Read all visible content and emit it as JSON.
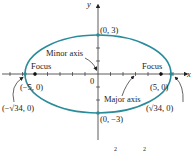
{
  "diagram": {
    "type": "ellipse",
    "axes": {
      "x_label": "x",
      "y_label": "y",
      "origin_label": "0"
    },
    "ellipse_color": "#2a8c9a",
    "points": {
      "top_vertex": "(0, 3)",
      "bottom_vertex": "(0, −3)",
      "left_focus": "(−5, 0)",
      "right_focus": "(5, 0)",
      "left_vertex": "(−√34, 0)",
      "right_vertex": "(√34, 0)"
    },
    "annotations": {
      "minor_axis": "Minor axis",
      "major_axis": "Major axis",
      "focus_left": "Focus",
      "focus_right": "Focus"
    },
    "equation_fragment": {
      "exp1": "2",
      "exp2": "2"
    }
  }
}
